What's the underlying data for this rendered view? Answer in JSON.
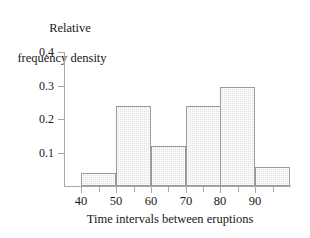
{
  "chart_data": {
    "type": "bar",
    "title": "",
    "subtitle": "",
    "xlabel": "Time intervals between eruptions",
    "ylabel": "Relative frequency density",
    "ylabel_lines": [
      "Relative",
      "frequency density"
    ],
    "grid": false,
    "legend": null,
    "xlim": [
      35,
      100
    ],
    "ylim": [
      0,
      0.4
    ],
    "x_tick_labels": [
      "40",
      "50",
      "60",
      "70",
      "80",
      "90"
    ],
    "x_tick_values": [
      40,
      50,
      60,
      70,
      80,
      90
    ],
    "x_minor_tick_values": [
      45,
      55,
      65,
      75,
      85,
      95
    ],
    "y_tick_labels": [
      "0.1",
      "0.2",
      "0.3",
      "0.4"
    ],
    "y_tick_values": [
      0.1,
      0.2,
      0.3,
      0.4
    ],
    "bin_edges": [
      40,
      50,
      60,
      70,
      80,
      100
    ],
    "bars": [
      {
        "label": "40-50",
        "x0": 40,
        "x1": 50,
        "value": 0.04
      },
      {
        "label": "50-60",
        "x0": 50,
        "x1": 60,
        "value": 0.238
      },
      {
        "label": "60-70",
        "x0": 60,
        "x1": 70,
        "value": 0.118
      },
      {
        "label": "70-80",
        "x0": 70,
        "x1": 80,
        "value": 0.238
      },
      {
        "label": "80-90",
        "x0": 80,
        "x1": 90,
        "value": 0.297
      },
      {
        "label": "90-100",
        "x0": 90,
        "x1": 100,
        "value": 0.057
      }
    ],
    "colors": {
      "bar_fill": "#e2e2e2",
      "bar_edge": "#9a9a9a",
      "axis": "#a8a8a8",
      "text": "#181818",
      "background": "#ffffff"
    }
  }
}
